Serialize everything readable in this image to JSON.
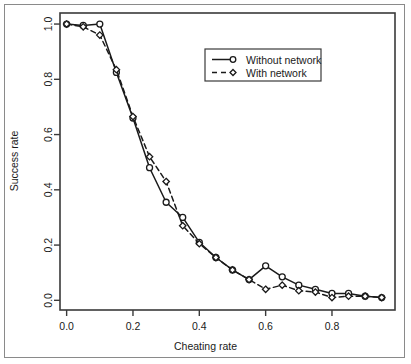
{
  "chart_data": {
    "type": "line",
    "title": "",
    "xlabel": "Cheating rate",
    "ylabel": "Success rate",
    "xlim": [
      -0.02,
      0.99
    ],
    "ylim": [
      -0.035,
      1.04
    ],
    "xticks": [
      "0.0",
      "0.2",
      "0.4",
      "0.6",
      "0.8"
    ],
    "xtick_values": [
      0.0,
      0.2,
      0.4,
      0.6,
      0.8
    ],
    "yticks": [
      "0.0",
      "0.2",
      "0.4",
      "0.6",
      "0.8",
      "1.0"
    ],
    "ytick_values": [
      0.0,
      0.2,
      0.4,
      0.6,
      0.8,
      1.0
    ],
    "grid": false,
    "legend_position": "top-center-right",
    "x": [
      0.0,
      0.05,
      0.1,
      0.15,
      0.2,
      0.25,
      0.3,
      0.35,
      0.4,
      0.45,
      0.5,
      0.55,
      0.6,
      0.65,
      0.7,
      0.75,
      0.8,
      0.85,
      0.9,
      0.95
    ],
    "series": [
      {
        "name": "Without network",
        "marker": "circle",
        "linestyle": "solid",
        "color": "#1a1a1a",
        "values": [
          1.0,
          0.995,
          1.0,
          0.825,
          0.66,
          0.48,
          0.355,
          0.3,
          0.21,
          0.155,
          0.11,
          0.075,
          0.125,
          0.085,
          0.055,
          0.04,
          0.025,
          0.025,
          0.015,
          0.01
        ]
      },
      {
        "name": "With network",
        "marker": "diamond",
        "linestyle": "dashed",
        "color": "#1a1a1a",
        "values": [
          1.0,
          0.99,
          0.96,
          0.835,
          0.665,
          0.52,
          0.43,
          0.27,
          0.205,
          0.155,
          0.11,
          0.075,
          0.04,
          0.055,
          0.035,
          0.03,
          0.01,
          0.015,
          0.015,
          0.01
        ]
      }
    ]
  },
  "legend": {
    "entries": [
      {
        "label": "Without network",
        "marker": "circle",
        "linestyle": "solid"
      },
      {
        "label": "With network",
        "marker": "diamond",
        "linestyle": "dashed"
      }
    ]
  },
  "colors": {
    "ink": "#1a1a1a",
    "frame": "#3a3a3a",
    "outer_border": "#8a8a8a",
    "background": "#ffffff"
  }
}
